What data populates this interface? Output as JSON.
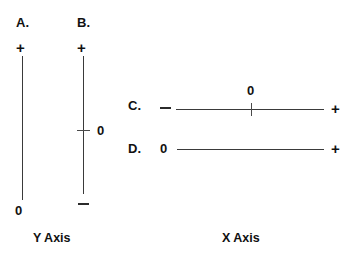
{
  "figure": {
    "background_color": "#ffffff",
    "line_color": "#3a3a3a",
    "text_color": "#111111",
    "captions": {
      "y_axis": "Y Axis",
      "x_axis": "X Axis"
    }
  },
  "panels": [
    {
      "id": "A",
      "letter": "A.",
      "orientation": "vertical",
      "top_marker": "+",
      "bottom_marker": "0",
      "has_interior_tick": false,
      "tick_label": "",
      "axis_group": "Y Axis"
    },
    {
      "id": "B",
      "letter": "B.",
      "orientation": "vertical",
      "top_marker": "+",
      "bottom_marker": "–",
      "has_interior_tick": true,
      "tick_label": "0",
      "axis_group": "Y Axis"
    },
    {
      "id": "C",
      "letter": "C.",
      "orientation": "horizontal",
      "left_marker": "–",
      "right_marker": "+",
      "has_interior_tick": true,
      "tick_label": "0",
      "axis_group": "X Axis"
    },
    {
      "id": "D",
      "letter": "D.",
      "orientation": "horizontal",
      "left_marker": "0",
      "right_marker": "+",
      "has_interior_tick": false,
      "tick_label": "",
      "axis_group": "X Axis"
    }
  ],
  "chart_data": {
    "type": "diagram",
    "title": "",
    "items": [
      {
        "label": "A.",
        "axis": "Y Axis",
        "start": "0",
        "end": "+",
        "zero_position": "end"
      },
      {
        "label": "B.",
        "axis": "Y Axis",
        "start": "–",
        "end": "+",
        "zero_position": "middle"
      },
      {
        "label": "C.",
        "axis": "X Axis",
        "start": "–",
        "end": "+",
        "zero_position": "middle"
      },
      {
        "label": "D.",
        "axis": "X Axis",
        "start": "0",
        "end": "+",
        "zero_position": "start"
      }
    ]
  }
}
